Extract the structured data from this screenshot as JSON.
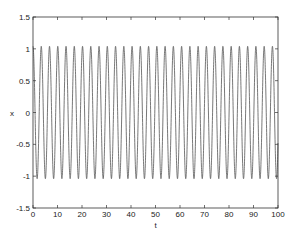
{
  "chart_data": {
    "type": "line",
    "title": "",
    "xlabel": "t",
    "ylabel": "x",
    "xlim": [
      0,
      100
    ],
    "ylim": [
      -1.5,
      1.5
    ],
    "xticks": [
      0,
      10,
      20,
      30,
      40,
      50,
      60,
      70,
      80,
      90,
      100
    ],
    "yticks": [
      -1.5,
      -1,
      -0.5,
      0,
      0.5,
      1,
      1.5
    ],
    "xtick_labels": [
      "0",
      "10",
      "20",
      "30",
      "40",
      "50",
      "60",
      "70",
      "80",
      "90",
      "100"
    ],
    "ytick_labels": [
      "-1.5",
      "-1",
      "-0.5",
      "0",
      "0.5",
      "1",
      "1.5"
    ],
    "grid": false,
    "legend": null,
    "series": [
      {
        "name": "x(t)",
        "color": "#555555",
        "description": "Periodic oscillation starting at x=1 at t=0, amplitude about 1.04, period about 3.37, ~30 cycles over t in [0,100]",
        "amplitude": 1.04,
        "period": 3.37,
        "x_start": 0,
        "x_end": 100,
        "peak_times": [
          0,
          3.4,
          6.7,
          10.1,
          13.5,
          16.8,
          20.2,
          23.6,
          27.0,
          30.3,
          33.7,
          37.1,
          40.4,
          43.8,
          47.2,
          50.5,
          53.9,
          57.3,
          60.7,
          64.0,
          67.4,
          70.8,
          74.1,
          77.5,
          80.9,
          84.2,
          87.6,
          91.0,
          94.4,
          97.7
        ],
        "peak_value": 1.04,
        "trough_value": -1.04
      }
    ]
  }
}
